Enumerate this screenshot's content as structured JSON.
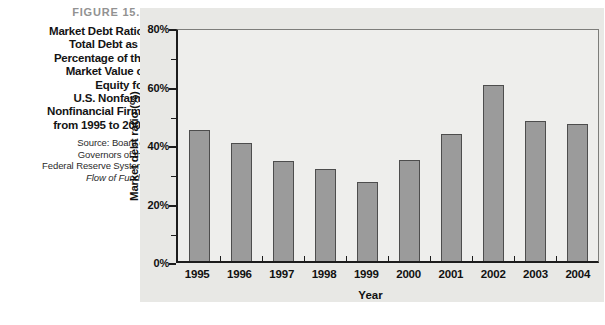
{
  "figure": {
    "label": "FIGURE 15.5",
    "title": "Market Debt Ratio:\nTotal Debt as a\nPercentage of the\nMarket Value of\nEquity for\nU.S. Nonfarm,\nNonfinancial Firms\nfrom 1995 to 2004",
    "source_text": "Source: Board of\nGovernors of the\nFederal Reserve System,",
    "source_italic": "Flow of Funds."
  },
  "chart_data": {
    "type": "bar",
    "categories": [
      "1995",
      "1996",
      "1997",
      "1998",
      "1999",
      "2000",
      "2001",
      "2002",
      "2003",
      "2004"
    ],
    "values": [
      45.5,
      41,
      34.5,
      32,
      27.5,
      35,
      44,
      61,
      48.5,
      47.5
    ],
    "xlabel": "Year",
    "ylabel": "Market debt ratio (%)",
    "ylim": [
      0,
      80
    ],
    "yticks": [
      0,
      20,
      40,
      60,
      80
    ],
    "ytick_labels": [
      "0%",
      "20%",
      "40%",
      "60%",
      "80%"
    ],
    "minor_yticks": [
      10,
      30,
      50,
      70
    ],
    "grid": false,
    "legend": false,
    "colors": {
      "bar_fill": "#9b9b9b",
      "bar_border": "#4d4d4d",
      "axis": "#1c1c1c",
      "panel_bg": "#e8e8e5",
      "plot_bg": "#eeeeec",
      "figure_label": "#929292"
    }
  }
}
